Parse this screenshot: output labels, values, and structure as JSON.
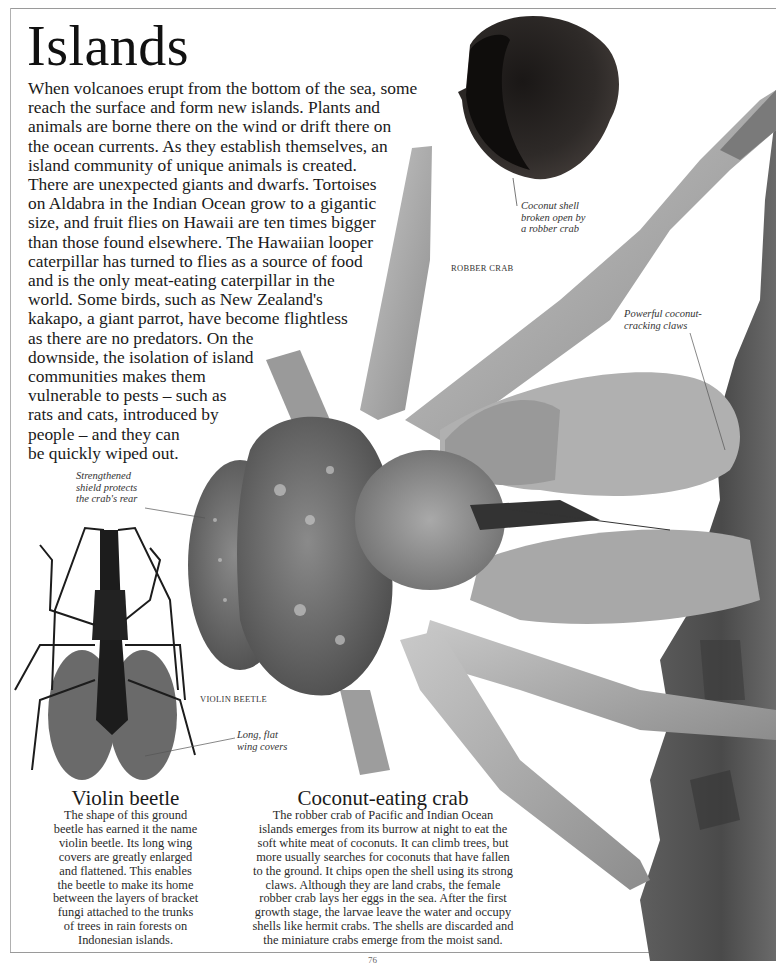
{
  "page": {
    "title": "Islands",
    "intro_lines": [
      "When volcanoes erupt from the bottom of the sea, some",
      "reach the surface and form new islands. Plants and",
      "animals are borne there on the wind or drift there on",
      "the ocean currents. As they establish themselves, an",
      "island community of unique animals is created.",
      "There are unexpected giants and dwarfs. Tortoises",
      "on Aldabra in the Indian Ocean grow to a gigantic",
      "size, and fruit flies on Hawaii are ten times bigger",
      "than those found elsewhere. The Hawaiian looper",
      "caterpillar has turned to flies as a source of food",
      "and is the only meat-eating caterpillar in the",
      "world. Some birds, such as New Zealand's",
      "kakapo, a giant parrot, have become flightless",
      "as there are no predators. On the",
      "downside, the isolation of island",
      "communities makes them",
      "vulnerable to pests – such as",
      "rats and cats, introduced by",
      "people – and they can",
      "be quickly wiped out."
    ],
    "folio": "76"
  },
  "captions": {
    "coconut_shell": [
      "Coconut shell",
      "broken open by",
      "a robber crab"
    ],
    "robber_crab_label": "ROBBER CRAB",
    "claws": [
      "Powerful coconut-",
      "cracking claws"
    ],
    "shield": [
      "Strengthened",
      "shield protects",
      "the crab's rear"
    ],
    "violin_beetle_label": "VIOLIN BEETLE",
    "wing_covers": [
      "Long, flat",
      "wing covers"
    ]
  },
  "sections": {
    "violin_beetle": {
      "heading": "Violin beetle",
      "lines": [
        "The shape of this ground",
        "beetle has earned it the name",
        "violin beetle. Its long wing",
        "covers are greatly enlarged",
        "and flattened. This enables",
        "the beetle to make its home",
        "between the layers of bracket",
        "fungi attached to the trunks",
        "of trees in rain forests on",
        "Indonesian islands."
      ]
    },
    "coconut_crab": {
      "heading": "Coconut-eating crab",
      "lines": [
        "The robber crab of Pacific and Indian Ocean",
        "islands emerges from its burrow at night to eat the",
        "soft white meat of coconuts. It can climb trees, but",
        "more usually searches for coconuts that have fallen",
        "to the ground. It chips open the shell using its strong",
        "claws. Although they are land crabs, the female",
        "robber crab lays her eggs in the sea. After the first",
        "growth stage, the larvae leave the water and occupy",
        "shells like hermit crabs. The shells are discarded and",
        "the miniature crabs emerge from the moist sand."
      ]
    }
  },
  "colors": {
    "paper": "#ffffff",
    "text": "#1a1a1a",
    "crab_light": "#b8b8b8",
    "crab_dark": "#6e6e6e",
    "bark": "#5a5a5a",
    "coconut": "#2a2624",
    "beetle_body": "#1c1c1c",
    "beetle_wing": "#6a6a6a"
  }
}
